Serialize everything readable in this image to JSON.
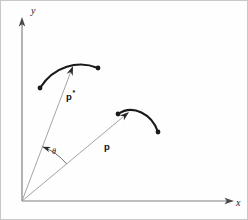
{
  "figure": {
    "background_color": "#fefefe",
    "border_color": "#c8c8c8",
    "axis_color": "#808080",
    "vector_color": "#9a9a9a",
    "curve_color": "#1a1a1a",
    "label_color": "#111111",
    "width": 248,
    "height": 220
  },
  "axes": {
    "x_label": "x",
    "y_label": "y",
    "origin": {
      "x": 22,
      "y": 201
    },
    "x_end": {
      "x": 231,
      "y": 201
    },
    "y_end": {
      "x": 22,
      "y": 18
    }
  },
  "labels": {
    "p_star": "p",
    "p_star_superscript": "*",
    "p": "p",
    "theta": "θ"
  },
  "vectors": [
    {
      "name": "p-star",
      "label": "p",
      "superscript": "*",
      "from": {
        "x": 22,
        "y": 201
      },
      "to": {
        "x": 73,
        "y": 66
      },
      "label_pos": {
        "x": 66,
        "y": 100
      }
    },
    {
      "name": "p",
      "label": "p",
      "superscript": "",
      "from": {
        "x": 22,
        "y": 201
      },
      "to": {
        "x": 129,
        "y": 112
      },
      "label_pos": {
        "x": 104,
        "y": 150
      }
    }
  ],
  "curves": [
    {
      "name": "upper-curve",
      "start": {
        "x": 40,
        "y": 88
      },
      "control1": {
        "x": 54,
        "y": 66
      },
      "control2": {
        "x": 78,
        "y": 60
      },
      "end": {
        "x": 98,
        "y": 68
      },
      "endpoint_dots": [
        {
          "x": 40,
          "y": 88
        },
        {
          "x": 98,
          "y": 68
        }
      ]
    },
    {
      "name": "lower-curve",
      "start": {
        "x": 118,
        "y": 114
      },
      "control1": {
        "x": 133,
        "y": 104
      },
      "control2": {
        "x": 152,
        "y": 114
      },
      "end": {
        "x": 158,
        "y": 132
      },
      "endpoint_dots": [
        {
          "x": 118,
          "y": 114
        },
        {
          "x": 158,
          "y": 132
        }
      ]
    }
  ],
  "angle_arc": {
    "name": "theta-arc",
    "label": "θ",
    "center": {
      "x": 22,
      "y": 201
    },
    "radius": 58,
    "start_angle_deg": 39.7,
    "end_angle_deg": 69.3,
    "label_pos": {
      "x": 52,
      "y": 154
    }
  }
}
